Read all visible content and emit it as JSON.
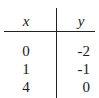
{
  "table": {
    "headers": [
      "x",
      "y"
    ],
    "rows": [
      [
        "0",
        "-2"
      ],
      [
        "1",
        "-1"
      ],
      [
        "4",
        "0"
      ]
    ]
  }
}
